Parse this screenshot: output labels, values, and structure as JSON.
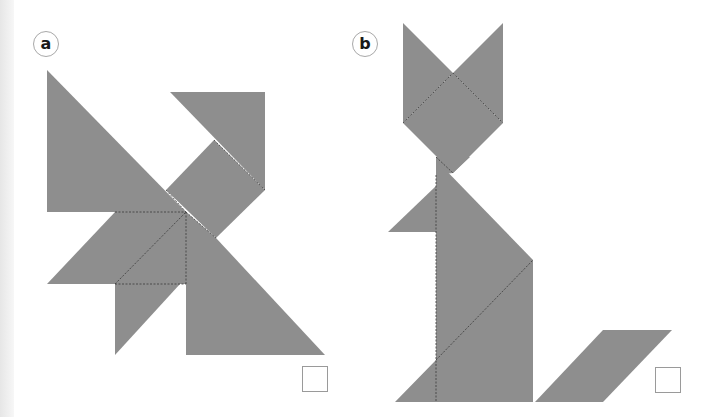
{
  "page": {
    "colors": {
      "piece": "#8e8e8e",
      "dash": "#3a3a3a",
      "label_border": "#a8a8a8"
    }
  },
  "puzzles": [
    {
      "label": "a",
      "shape": "tangram-figure-a",
      "answer_box": ""
    },
    {
      "label": "b",
      "shape": "tangram-cat",
      "answer_box": ""
    }
  ]
}
